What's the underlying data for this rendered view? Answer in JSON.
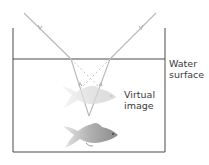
{
  "diagram": {
    "labels": {
      "water_surface_line1": "Water",
      "water_surface_line2": "surface",
      "virtual_image_line1": "Virtual",
      "virtual_image_line2": "image"
    },
    "elements": {
      "tank": "Water tank outline",
      "water_surface": "Horizontal water surface line",
      "real_fish": "Real fish (lower)",
      "virtual_fish": "Virtual image of fish (upper, faded)",
      "light_rays": "Rays refracting at surface toward observer",
      "virtual_ray_extensions": "Dashed backward extensions of refracted rays"
    },
    "colors": {
      "tank_line": "#4a4a4a",
      "ray": "#b8b8b8",
      "dashed": "#c8c8c8",
      "text": "#3a3a3a",
      "real_fish": "#9a9a9a",
      "virtual_fish": "#d4d4d4"
    }
  }
}
